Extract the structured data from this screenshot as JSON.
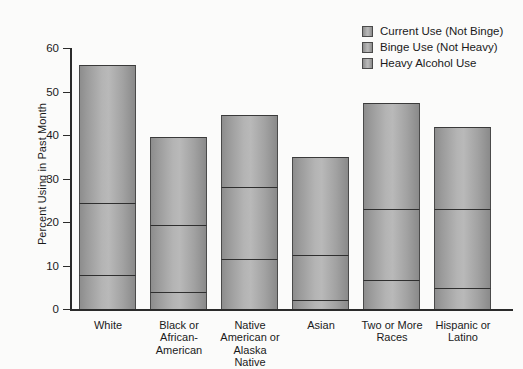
{
  "chart_data": {
    "type": "bar",
    "subtype": "stacked-bar",
    "title": "",
    "xlabel": "",
    "ylabel": "Percent Using in Past Month",
    "ylim": [
      0,
      60
    ],
    "yticks": [
      0,
      10,
      20,
      30,
      40,
      50,
      60
    ],
    "ytick_labels": [
      "0",
      "10",
      "20",
      "30",
      "40",
      "50",
      "60"
    ],
    "grid": false,
    "legend_position": "top-right",
    "categories": [
      "White",
      "Black or African-American",
      "Native American or Alaska Native",
      "Asian",
      "Two or More Races",
      "Hispanic or Latino"
    ],
    "category_label_lines": [
      [
        "White"
      ],
      [
        "Black or",
        "African-",
        "American"
      ],
      [
        "Native",
        "American or",
        "Alaska",
        "Native"
      ],
      [
        "Asian"
      ],
      [
        "Two or More",
        "Races"
      ],
      [
        "Hispanic or",
        "Latino"
      ]
    ],
    "series": [
      {
        "name": "Current Use (Not Binge)",
        "values": [
          31.6,
          20.4,
          16.4,
          22.5,
          24.3,
          18.8
        ]
      },
      {
        "name": "Binge Use (Not Heavy)",
        "values": [
          16.6,
          15.4,
          16.5,
          10.5,
          16.3,
          18.1
        ]
      },
      {
        "name": "Heavy Alcohol Use",
        "values": [
          7.8,
          3.8,
          11.6,
          2.0,
          6.7,
          4.9
        ]
      }
    ],
    "cumulative_totals": [
      56.0,
      39.6,
      44.5,
      35.0,
      47.3,
      41.8
    ],
    "segment_boundaries": [
      [
        7.8,
        24.4,
        56.0
      ],
      [
        3.8,
        19.2,
        39.6
      ],
      [
        11.6,
        28.1,
        44.5
      ],
      [
        2.0,
        12.5,
        35.0
      ],
      [
        6.7,
        23.0,
        47.3
      ],
      [
        4.9,
        23.0,
        41.8
      ]
    ],
    "colors": {
      "bar_fill_light": "#b9b9b9",
      "bar_fill_dark": "#8a8a8a",
      "bar_outline": "#2f2f2f",
      "axis": "#2b2b2b",
      "background": "#fbfbfa",
      "text": "#1a1a1a"
    }
  },
  "legend": {
    "items": [
      {
        "label": "Current Use (Not Binge)"
      },
      {
        "label": "Binge Use (Not Heavy)"
      },
      {
        "label": "Heavy Alcohol Use"
      }
    ]
  },
  "axes": {
    "y_title": "Percent Using in Past Month"
  }
}
